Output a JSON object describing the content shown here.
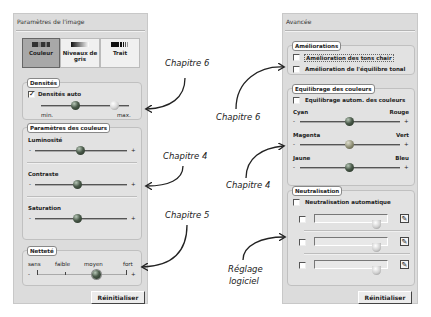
{
  "left_panel": {
    "title": "Paramètres de l'image",
    "tabs": [
      {
        "label": "Couleur",
        "icon": "color-swatch-icon",
        "active": true
      },
      {
        "label": "Niveaux de gris",
        "icon": "grayscale-swatch-icon",
        "active": false
      },
      {
        "label": "Trait",
        "icon": "line-art-swatch-icon",
        "active": false
      }
    ],
    "densites": {
      "label": "Densités",
      "auto_checkbox": {
        "label": "Densités auto",
        "checked": true
      },
      "min_label": "min.",
      "max_label": "max."
    },
    "couleurs": {
      "label": "Paramètres des couleurs",
      "luminosite": {
        "label": "Luminosité",
        "minus": "-",
        "plus": "+"
      },
      "contraste": {
        "label": "Contraste",
        "minus": "-",
        "plus": "+"
      },
      "saturation": {
        "label": "Saturation",
        "minus": "-",
        "plus": "+"
      }
    },
    "nettete": {
      "label": "Netteté",
      "ticks": [
        "sans",
        "faible",
        "moyen",
        "fort"
      ],
      "minus": "-",
      "plus": "+",
      "value": "moyen"
    },
    "reset_button": "Réinitialiser"
  },
  "right_panel": {
    "title": "Avancée",
    "ameliorations": {
      "label": "Améliorations",
      "items": [
        {
          "label": "Amélioration des tons chair",
          "checked": false
        },
        {
          "label": "Amélioration de l'équilibre tonal",
          "checked": false
        }
      ]
    },
    "equilibrage": {
      "label": "Equilibrage des couleurs",
      "auto_checkbox": {
        "label": "Equilibrage autom. des couleurs",
        "checked": false
      },
      "sliders": [
        {
          "left": "Cyan",
          "right": "Rouge",
          "minus": "-",
          "plus": "+"
        },
        {
          "left": "Magenta",
          "right": "Vert",
          "minus": "-",
          "plus": "+"
        },
        {
          "left": "Jaune",
          "right": "Bleu",
          "minus": "-",
          "plus": "+"
        }
      ]
    },
    "neutralisation": {
      "label": "Neutralisation",
      "auto_checkbox": {
        "label": "Neutralisation automatique",
        "checked": false
      },
      "rows": [
        {
          "checked": false,
          "picker_icon": "eyedropper-icon"
        },
        {
          "checked": false,
          "picker_icon": "eyedropper-icon"
        },
        {
          "checked": false,
          "picker_icon": "eyedropper-icon"
        }
      ]
    },
    "reset_button": "Réinitialiser"
  },
  "annotations": [
    {
      "text": "Chapitre 6",
      "target": "densites"
    },
    {
      "text": "Chapitre 4",
      "target": "couleurs"
    },
    {
      "text": "Chapitre 5",
      "target": "nettete"
    },
    {
      "text": "Chapitre 6",
      "target": "ameliorations"
    },
    {
      "text": "Chapitre 4",
      "target": "equilibrage"
    },
    {
      "text": "Réglage",
      "line2": "logiciel",
      "target": "neutralisation"
    }
  ]
}
